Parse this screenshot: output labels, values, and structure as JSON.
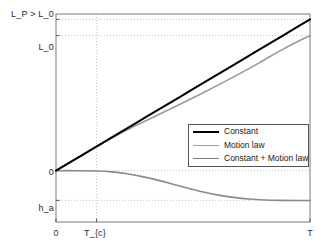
{
  "chart_data": {
    "type": "line",
    "title": "",
    "xlabel": "",
    "ylabel": "",
    "grid": true,
    "legend_position": "center-right",
    "x_ticks": [
      {
        "label": "0",
        "value": 0
      },
      {
        "label": "T_{c}",
        "value": 0.16
      },
      {
        "label": "T",
        "value": 1
      }
    ],
    "y_ticks": [
      {
        "label": "L_P > L_0",
        "value": 1.12
      },
      {
        "label": "L_0",
        "value": 1.0
      },
      {
        "label": "0",
        "value": 0.0
      },
      {
        "label": "h_a",
        "value": -0.22
      }
    ],
    "xlim": [
      0,
      1
    ],
    "ylim": [
      -0.38,
      1.16
    ],
    "series": [
      {
        "name": "Constant",
        "color": "#000000",
        "width": 2.0,
        "x": [
          0,
          0.1,
          0.2,
          0.3,
          0.4,
          0.5,
          0.6,
          0.7,
          0.8,
          0.9,
          1.0
        ],
        "y": [
          0,
          0.112,
          0.224,
          0.336,
          0.448,
          0.56,
          0.672,
          0.784,
          0.896,
          1.008,
          1.12
        ]
      },
      {
        "name": "Motion law",
        "color": "#9a9a9a",
        "width": 1.6,
        "x": [
          0,
          0.08,
          0.16,
          0.24,
          0.32,
          0.4,
          0.48,
          0.56,
          0.64,
          0.72,
          0.8,
          0.88,
          0.94,
          1.0
        ],
        "y": [
          0,
          0.09,
          0.179,
          0.262,
          0.339,
          0.412,
          0.484,
          0.558,
          0.635,
          0.715,
          0.798,
          0.885,
          0.945,
          1.0
        ]
      },
      {
        "name": "Constant + Motion law",
        "color": "#8a8a8a",
        "width": 1.6,
        "x": [
          0,
          0.08,
          0.16,
          0.22,
          0.28,
          0.34,
          0.4,
          0.46,
          0.52,
          0.58,
          0.64,
          0.7,
          0.76,
          0.82,
          0.88,
          0.94,
          1.0
        ],
        "y": [
          0,
          0.0,
          -0.002,
          -0.009,
          -0.023,
          -0.044,
          -0.07,
          -0.1,
          -0.13,
          -0.158,
          -0.181,
          -0.198,
          -0.21,
          -0.217,
          -0.22,
          -0.221,
          -0.221
        ]
      }
    ]
  },
  "legend": {
    "entries": [
      {
        "label": "Constant",
        "color": "#000000"
      },
      {
        "label": "Motion law",
        "color": "#9e9e9e"
      },
      {
        "label": "Constant + Motion law",
        "color": "#7d7d7d"
      }
    ]
  },
  "axes": {
    "y_labels": [
      "L_P > L_0",
      "L_0",
      "0",
      "h_a"
    ],
    "x_labels": [
      "0",
      "T_{c}",
      "T"
    ]
  }
}
